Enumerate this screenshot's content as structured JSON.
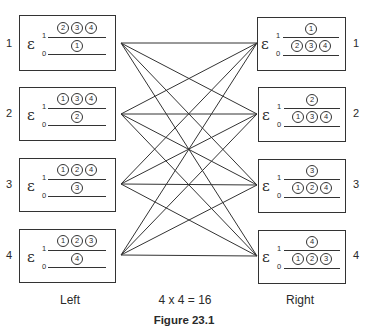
{
  "figure": {
    "title": "Figure 23.1",
    "left_label": "Left",
    "right_label": "Right",
    "equation": "4 x 4 = 16",
    "symbol": "ε",
    "index_top": "1",
    "index_bottom": "0"
  },
  "left_boxes": [
    {
      "row": "1",
      "top": [
        "②",
        "③",
        "④"
      ],
      "bottom": [
        "①"
      ]
    },
    {
      "row": "2",
      "top": [
        "①",
        "③",
        "④"
      ],
      "bottom": [
        "②"
      ]
    },
    {
      "row": "3",
      "top": [
        "①",
        "②",
        "④"
      ],
      "bottom": [
        "③"
      ]
    },
    {
      "row": "4",
      "top": [
        "①",
        "②",
        "③"
      ],
      "bottom": [
        "④"
      ]
    }
  ],
  "right_boxes": [
    {
      "row": "1",
      "top": [
        "①"
      ],
      "bottom": [
        "②",
        "③",
        "④"
      ]
    },
    {
      "row": "2",
      "top": [
        "②"
      ],
      "bottom": [
        "①",
        "③",
        "④"
      ]
    },
    {
      "row": "3",
      "top": [
        "③"
      ],
      "bottom": [
        "①",
        "②",
        "④"
      ]
    },
    {
      "row": "4",
      "top": [
        "④"
      ],
      "bottom": [
        "①",
        "②",
        "③"
      ]
    }
  ],
  "connections": {
    "description": "Every left box connects to every right box (complete bipartite 4x4)",
    "count": 16
  }
}
